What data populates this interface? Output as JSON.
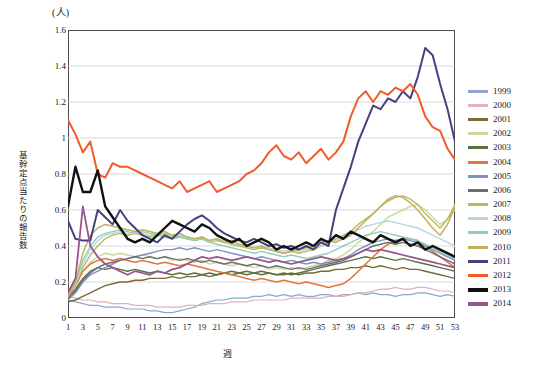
{
  "chart_data": {
    "type": "line",
    "title": "",
    "unit_label": "(人)",
    "ylabel": "基幹定点当たりの報告数",
    "xlabel": "週",
    "ylim": [
      0,
      1.6
    ],
    "ytick_values": [
      "0",
      "0.2",
      "0.4",
      "0.6",
      "0.8",
      "1",
      "1.2",
      "1.4",
      "1.6"
    ],
    "xlim": [
      1,
      53
    ],
    "xtick_values": [
      "1",
      "3",
      "5",
      "7",
      "9",
      "11",
      "13",
      "15",
      "17",
      "19",
      "21",
      "23",
      "25",
      "27",
      "29",
      "31",
      "33",
      "35",
      "37",
      "39",
      "41",
      "43",
      "45",
      "47",
      "49",
      "51",
      "53"
    ],
    "grid": "horizontal",
    "legend_position": "right",
    "x": [
      1,
      2,
      3,
      4,
      5,
      6,
      7,
      8,
      9,
      10,
      11,
      12,
      13,
      14,
      15,
      16,
      17,
      18,
      19,
      20,
      21,
      22,
      23,
      24,
      25,
      26,
      27,
      28,
      29,
      30,
      31,
      32,
      33,
      34,
      35,
      36,
      37,
      38,
      39,
      40,
      41,
      42,
      43,
      44,
      45,
      46,
      47,
      48,
      49,
      50,
      51,
      52,
      53
    ],
    "series": [
      {
        "name": "1999",
        "color": "#8ea6cf",
        "width": 1.2,
        "values": [
          0.1,
          0.09,
          0.08,
          0.07,
          0.07,
          0.06,
          0.06,
          0.06,
          0.05,
          0.05,
          0.05,
          0.04,
          0.04,
          0.03,
          0.03,
          0.04,
          0.05,
          0.06,
          0.08,
          0.09,
          0.1,
          0.1,
          0.11,
          0.11,
          0.11,
          0.12,
          0.12,
          0.13,
          0.12,
          0.13,
          0.12,
          0.13,
          0.12,
          0.12,
          0.13,
          0.13,
          0.12,
          0.13,
          0.13,
          0.14,
          0.13,
          0.14,
          0.13,
          0.13,
          0.12,
          0.13,
          0.13,
          0.14,
          0.14,
          0.13,
          0.12,
          0.13,
          0.12
        ]
      },
      {
        "name": "2000",
        "color": "#e0b3b6",
        "width": 1.2,
        "values": [
          0.12,
          0.11,
          0.1,
          0.1,
          0.09,
          0.09,
          0.08,
          0.08,
          0.08,
          0.07,
          0.07,
          0.07,
          0.06,
          0.06,
          0.06,
          0.06,
          0.07,
          0.07,
          0.07,
          0.08,
          0.08,
          0.08,
          0.09,
          0.09,
          0.09,
          0.1,
          0.1,
          0.1,
          0.1,
          0.1,
          0.11,
          0.11,
          0.11,
          0.11,
          0.11,
          0.12,
          0.12,
          0.12,
          0.13,
          0.14,
          0.14,
          0.15,
          0.16,
          0.16,
          0.17,
          0.16,
          0.16,
          0.17,
          0.17,
          0.16,
          0.15,
          0.15,
          0.14
        ]
      },
      {
        "name": "2001",
        "color": "#7a6b35",
        "width": 1.4,
        "values": [
          0.09,
          0.1,
          0.12,
          0.14,
          0.16,
          0.18,
          0.19,
          0.2,
          0.2,
          0.21,
          0.21,
          0.22,
          0.22,
          0.22,
          0.23,
          0.22,
          0.23,
          0.23,
          0.24,
          0.23,
          0.24,
          0.25,
          0.24,
          0.25,
          0.24,
          0.25,
          0.24,
          0.25,
          0.24,
          0.24,
          0.25,
          0.24,
          0.25,
          0.25,
          0.26,
          0.26,
          0.27,
          0.27,
          0.28,
          0.28,
          0.29,
          0.28,
          0.29,
          0.28,
          0.27,
          0.28,
          0.27,
          0.27,
          0.26,
          0.25,
          0.24,
          0.23,
          0.22
        ]
      },
      {
        "name": "2002",
        "color": "#cdd79a",
        "width": 1.4,
        "values": [
          0.14,
          0.18,
          0.26,
          0.31,
          0.34,
          0.36,
          0.35,
          0.36,
          0.35,
          0.34,
          0.35,
          0.34,
          0.33,
          0.34,
          0.32,
          0.33,
          0.32,
          0.31,
          0.32,
          0.3,
          0.31,
          0.3,
          0.29,
          0.3,
          0.29,
          0.28,
          0.29,
          0.27,
          0.28,
          0.27,
          0.28,
          0.27,
          0.28,
          0.29,
          0.3,
          0.32,
          0.33,
          0.35,
          0.38,
          0.42,
          0.45,
          0.48,
          0.52,
          0.56,
          0.58,
          0.6,
          0.62,
          0.63,
          0.6,
          0.56,
          0.52,
          0.55,
          0.6
        ]
      },
      {
        "name": "2003",
        "color": "#5a7342",
        "width": 1.4,
        "values": [
          0.12,
          0.16,
          0.22,
          0.26,
          0.28,
          0.27,
          0.28,
          0.27,
          0.26,
          0.27,
          0.26,
          0.25,
          0.26,
          0.25,
          0.24,
          0.25,
          0.24,
          0.25,
          0.24,
          0.25,
          0.24,
          0.25,
          0.26,
          0.25,
          0.26,
          0.25,
          0.26,
          0.25,
          0.24,
          0.25,
          0.24,
          0.25,
          0.26,
          0.27,
          0.28,
          0.29,
          0.3,
          0.31,
          0.32,
          0.33,
          0.34,
          0.33,
          0.34,
          0.33,
          0.32,
          0.33,
          0.32,
          0.31,
          0.3,
          0.29,
          0.28,
          0.27,
          0.26
        ]
      },
      {
        "name": "2004",
        "color": "#e2763b",
        "width": 1.5,
        "values": [
          0.13,
          0.18,
          0.26,
          0.3,
          0.32,
          0.33,
          0.32,
          0.33,
          0.32,
          0.31,
          0.32,
          0.31,
          0.3,
          0.31,
          0.3,
          0.29,
          0.3,
          0.29,
          0.28,
          0.27,
          0.26,
          0.25,
          0.24,
          0.23,
          0.22,
          0.21,
          0.22,
          0.21,
          0.2,
          0.21,
          0.2,
          0.19,
          0.2,
          0.19,
          0.18,
          0.17,
          0.18,
          0.19,
          0.22,
          0.26,
          0.3,
          0.34,
          0.38,
          0.41,
          0.43,
          0.44,
          0.44,
          0.43,
          0.4,
          0.37,
          0.34,
          0.31,
          0.28
        ]
      },
      {
        "name": "2005",
        "color": "#7d92c4",
        "width": 1.4,
        "values": [
          0.1,
          0.14,
          0.2,
          0.24,
          0.26,
          0.28,
          0.3,
          0.32,
          0.33,
          0.34,
          0.35,
          0.36,
          0.37,
          0.38,
          0.38,
          0.39,
          0.38,
          0.39,
          0.38,
          0.37,
          0.38,
          0.37,
          0.36,
          0.35,
          0.34,
          0.33,
          0.34,
          0.33,
          0.32,
          0.31,
          0.32,
          0.31,
          0.3,
          0.31,
          0.3,
          0.31,
          0.32,
          0.33,
          0.35,
          0.38,
          0.4,
          0.42,
          0.43,
          0.44,
          0.43,
          0.44,
          0.43,
          0.42,
          0.4,
          0.38,
          0.36,
          0.34,
          0.32
        ]
      },
      {
        "name": "2006",
        "color": "#6e6e6e",
        "width": 1.4,
        "values": [
          0.11,
          0.15,
          0.21,
          0.25,
          0.28,
          0.3,
          0.31,
          0.32,
          0.33,
          0.34,
          0.33,
          0.34,
          0.33,
          0.34,
          0.33,
          0.32,
          0.33,
          0.32,
          0.31,
          0.32,
          0.31,
          0.3,
          0.31,
          0.3,
          0.29,
          0.3,
          0.29,
          0.28,
          0.29,
          0.28,
          0.27,
          0.28,
          0.27,
          0.28,
          0.29,
          0.3,
          0.31,
          0.32,
          0.34,
          0.36,
          0.38,
          0.4,
          0.41,
          0.42,
          0.41,
          0.42,
          0.41,
          0.4,
          0.38,
          0.36,
          0.34,
          0.32,
          0.3
        ]
      },
      {
        "name": "2007",
        "color": "#b5bc5e",
        "width": 1.4,
        "values": [
          0.12,
          0.18,
          0.28,
          0.35,
          0.4,
          0.44,
          0.46,
          0.47,
          0.46,
          0.47,
          0.46,
          0.45,
          0.46,
          0.45,
          0.44,
          0.45,
          0.44,
          0.43,
          0.44,
          0.42,
          0.43,
          0.42,
          0.41,
          0.4,
          0.39,
          0.38,
          0.39,
          0.38,
          0.37,
          0.36,
          0.37,
          0.36,
          0.37,
          0.38,
          0.4,
          0.42,
          0.44,
          0.46,
          0.48,
          0.52,
          0.55,
          0.58,
          0.62,
          0.65,
          0.67,
          0.68,
          0.66,
          0.63,
          0.58,
          0.54,
          0.5,
          0.55,
          0.63
        ]
      },
      {
        "name": "2008",
        "color": "#b9d7da",
        "width": 1.4,
        "values": [
          0.13,
          0.19,
          0.3,
          0.38,
          0.43,
          0.46,
          0.47,
          0.48,
          0.47,
          0.48,
          0.47,
          0.46,
          0.47,
          0.46,
          0.45,
          0.46,
          0.45,
          0.44,
          0.45,
          0.43,
          0.44,
          0.43,
          0.42,
          0.41,
          0.4,
          0.39,
          0.4,
          0.39,
          0.38,
          0.37,
          0.38,
          0.37,
          0.38,
          0.39,
          0.4,
          0.42,
          0.43,
          0.45,
          0.47,
          0.49,
          0.51,
          0.52,
          0.53,
          0.54,
          0.53,
          0.52,
          0.51,
          0.5,
          0.48,
          0.46,
          0.44,
          0.42,
          0.4
        ]
      },
      {
        "name": "2009",
        "color": "#8fcfc0",
        "width": 1.4,
        "values": [
          0.14,
          0.2,
          0.32,
          0.4,
          0.45,
          0.47,
          0.48,
          0.49,
          0.48,
          0.47,
          0.48,
          0.47,
          0.46,
          0.47,
          0.46,
          0.45,
          0.44,
          0.43,
          0.44,
          0.42,
          0.41,
          0.4,
          0.39,
          0.38,
          0.37,
          0.36,
          0.37,
          0.36,
          0.35,
          0.34,
          0.35,
          0.34,
          0.33,
          0.34,
          0.35,
          0.36,
          0.38,
          0.4,
          0.42,
          0.44,
          0.46,
          0.47,
          0.48,
          0.47,
          0.46,
          0.45,
          0.44,
          0.43,
          0.41,
          0.39,
          0.37,
          0.35,
          0.33
        ]
      },
      {
        "name": "2010",
        "color": "#c5b05a",
        "width": 1.5,
        "values": [
          0.12,
          0.2,
          0.36,
          0.46,
          0.5,
          0.52,
          0.51,
          0.5,
          0.49,
          0.48,
          0.49,
          0.48,
          0.47,
          0.48,
          0.46,
          0.47,
          0.45,
          0.44,
          0.45,
          0.43,
          0.44,
          0.42,
          0.43,
          0.41,
          0.4,
          0.39,
          0.4,
          0.38,
          0.37,
          0.36,
          0.37,
          0.38,
          0.39,
          0.4,
          0.42,
          0.43,
          0.42,
          0.44,
          0.46,
          0.5,
          0.54,
          0.58,
          0.62,
          0.66,
          0.68,
          0.67,
          0.64,
          0.6,
          0.55,
          0.5,
          0.46,
          0.52,
          0.62
        ]
      },
      {
        "name": "2011",
        "color": "#44427e",
        "width": 2.0,
        "values": [
          0.54,
          0.44,
          0.43,
          0.43,
          0.6,
          0.56,
          0.52,
          0.6,
          0.54,
          0.5,
          0.46,
          0.44,
          0.42,
          0.46,
          0.44,
          0.48,
          0.52,
          0.55,
          0.57,
          0.54,
          0.5,
          0.47,
          0.45,
          0.43,
          0.42,
          0.44,
          0.42,
          0.4,
          0.41,
          0.39,
          0.4,
          0.38,
          0.4,
          0.38,
          0.42,
          0.4,
          0.6,
          0.72,
          0.84,
          0.98,
          1.08,
          1.18,
          1.16,
          1.22,
          1.2,
          1.26,
          1.22,
          1.34,
          1.5,
          1.46,
          1.3,
          1.16,
          0.98
        ]
      },
      {
        "name": "2012",
        "color": "#f15a29",
        "width": 2.0,
        "values": [
          1.1,
          1.02,
          0.92,
          0.98,
          0.8,
          0.78,
          0.86,
          0.84,
          0.84,
          0.82,
          0.8,
          0.78,
          0.76,
          0.74,
          0.72,
          0.76,
          0.7,
          0.72,
          0.74,
          0.76,
          0.7,
          0.72,
          0.74,
          0.76,
          0.8,
          0.82,
          0.86,
          0.92,
          0.96,
          0.9,
          0.88,
          0.92,
          0.86,
          0.9,
          0.94,
          0.88,
          0.92,
          0.98,
          1.12,
          1.22,
          1.26,
          1.2,
          1.26,
          1.24,
          1.28,
          1.26,
          1.3,
          1.24,
          1.12,
          1.06,
          1.04,
          0.94,
          0.88
        ]
      },
      {
        "name": "2013",
        "color": "#111111",
        "width": 2.4,
        "values": [
          0.62,
          0.84,
          0.7,
          0.7,
          0.82,
          0.62,
          0.56,
          0.5,
          0.44,
          0.42,
          0.44,
          0.42,
          0.46,
          0.5,
          0.54,
          0.52,
          0.5,
          0.48,
          0.52,
          0.5,
          0.46,
          0.44,
          0.42,
          0.44,
          0.4,
          0.42,
          0.44,
          0.42,
          0.38,
          0.4,
          0.38,
          0.4,
          0.42,
          0.4,
          0.44,
          0.42,
          0.46,
          0.44,
          0.48,
          0.46,
          0.44,
          0.42,
          0.46,
          0.44,
          0.42,
          0.44,
          0.4,
          0.42,
          0.38,
          0.4,
          0.38,
          0.36,
          0.34
        ]
      },
      {
        "name": "2014",
        "color": "#97568c",
        "width": 1.8,
        "values": [
          0.14,
          0.22,
          0.62,
          0.4,
          0.34,
          0.3,
          0.28,
          0.26,
          0.24,
          0.26,
          0.25,
          0.24,
          0.26,
          0.25,
          0.27,
          0.28,
          0.3,
          0.32,
          0.34,
          0.33,
          0.34,
          0.33,
          0.32,
          0.33,
          0.34,
          0.33,
          0.32,
          0.31,
          0.32,
          0.31,
          0.3,
          0.31,
          0.32,
          0.33,
          0.34,
          0.33,
          0.32,
          0.33,
          0.34,
          0.36,
          0.38,
          0.37,
          0.38,
          0.37,
          0.36,
          0.35,
          0.34,
          0.33,
          0.32,
          0.31,
          0.3,
          0.29,
          0.28
        ]
      }
    ]
  }
}
